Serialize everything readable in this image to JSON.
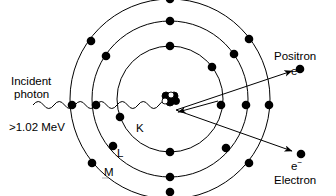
{
  "diagram": {
    "type": "physics-schematic",
    "colors": {
      "stroke": "#000000",
      "electron_fill": "#000000",
      "background": "#ffffff",
      "nucleus_proton": "#ffffff",
      "nucleus_neutron": "#000000"
    },
    "labels": {
      "incident_line1": "Incident",
      "incident_line2": "photon",
      "energy": ">1.02 MeV",
      "positron_name": "Positron",
      "positron_symbol": "e",
      "positron_charge": "+",
      "electron_symbol": "e",
      "electron_charge": "−",
      "electron_name": "Electron",
      "shell_k": "K",
      "shell_l": "L",
      "shell_m": "M"
    },
    "atom": {
      "center_x": 170,
      "center_y": 99,
      "shells": [
        {
          "name": "K",
          "radius": 53,
          "electron_angles_deg": [
            90,
            270,
            38,
            15,
            200
          ]
        },
        {
          "name": "L",
          "radius": 78,
          "electron_angles_deg": [
            90,
            270,
            35,
            12,
            145,
            215,
            245
          ]
        },
        {
          "name": "M",
          "radius": 100,
          "electron_angles_deg": [
            90,
            270,
            38,
            10,
            142,
            170,
            200,
            230,
            320
          ]
        }
      ],
      "nucleus_particles": [
        {
          "dx": -4,
          "dy": -3,
          "r": 4,
          "fill": "#000000"
        },
        {
          "dx": 4,
          "dy": -3,
          "r": 4,
          "fill": "#000000"
        },
        {
          "dx": 0,
          "dy": 3,
          "r": 4,
          "fill": "#000000"
        },
        {
          "dx": 6,
          "dy": 2,
          "r": 3.5,
          "fill": "#000000"
        },
        {
          "dx": -5,
          "dy": 2,
          "r": 3,
          "fill": "#ffffff"
        },
        {
          "dx": 1,
          "dy": -4,
          "r": 3,
          "fill": "#ffffff"
        }
      ]
    },
    "photon": {
      "start_x": 33,
      "end_x": 172,
      "baseline_y": 105,
      "amplitude": 5,
      "wavelength": 21
    },
    "product_rays": [
      {
        "name": "positron-ray",
        "x1": 176,
        "y1": 110,
        "x2": 293,
        "y2": 71,
        "dot_x": 299,
        "dot_y": 69
      },
      {
        "name": "electron-ray",
        "x1": 176,
        "y1": 110,
        "x2": 293,
        "y2": 151,
        "dot_x": 300,
        "dot_y": 154
      }
    ],
    "incoming_arrow": {
      "x1": 215,
      "y1": 102,
      "x2": 176,
      "y2": 112
    }
  }
}
